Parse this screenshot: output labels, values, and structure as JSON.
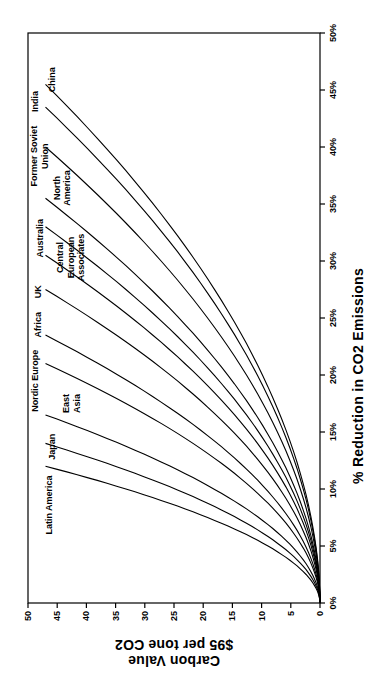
{
  "figure": {
    "background_color": "#ffffff",
    "line_color": "#000000",
    "text_color": "#000000",
    "rotation_deg": -90
  },
  "chart_data": {
    "type": "line",
    "title": "",
    "xlabel": "% Reduction in CO2 Emissions",
    "ylabel_lines": [
      "Carbon Value",
      "$95 per tone CO2"
    ],
    "legend": "none (curves labeled directly at their endpoints)",
    "grid": false,
    "x_axis": {
      "min": 0,
      "max": 50,
      "tick_step": 5,
      "tick_labels": [
        "0%",
        "5%",
        "10%",
        "15%",
        "20%",
        "25%",
        "30%",
        "35%",
        "40%",
        "45%",
        "50%"
      ]
    },
    "y_axis": {
      "min": 0,
      "max": 50,
      "tick_step": 5,
      "tick_labels": [
        "0",
        "5",
        "10",
        "15",
        "20",
        "25",
        "30",
        "35",
        "40",
        "45",
        "50"
      ]
    },
    "curve_model": {
      "tip_carbon_value": 47,
      "exponent": 1.9
    },
    "series": [
      {
        "name": "Latin America",
        "max_reduction_pct": 12,
        "points": [
          [
            0,
            0
          ],
          [
            2.4,
            2.2
          ],
          [
            4.8,
            8.2
          ],
          [
            7.2,
            17.8
          ],
          [
            9.6,
            30.8
          ],
          [
            12,
            47
          ]
        ],
        "label_lines": [
          "Latin America"
        ],
        "label_x": 8.6,
        "label_y": 46.4
      },
      {
        "name": "Japan",
        "max_reduction_pct": 14,
        "points": [
          [
            0,
            0
          ],
          [
            2.8,
            2.2
          ],
          [
            5.6,
            8.2
          ],
          [
            8.4,
            17.8
          ],
          [
            11.2,
            30.8
          ],
          [
            14,
            47
          ]
        ],
        "label_lines": [
          "Japan"
        ],
        "label_x": 13.7,
        "label_y": 45.9
      },
      {
        "name": "East Asia",
        "max_reduction_pct": 16.5,
        "points": [
          [
            0,
            0
          ],
          [
            3.3,
            2.2
          ],
          [
            6.6,
            8.2
          ],
          [
            9.9,
            17.8
          ],
          [
            13.2,
            30.8
          ],
          [
            16.5,
            47
          ]
        ],
        "label_lines": [
          "East",
          "Asia"
        ],
        "label_x": 17.5,
        "label_y": 42.6
      },
      {
        "name": "Nordic Europe",
        "max_reduction_pct": 21,
        "points": [
          [
            0,
            0
          ],
          [
            4.2,
            2.2
          ],
          [
            8.4,
            8.2
          ],
          [
            12.6,
            17.8
          ],
          [
            16.8,
            30.8
          ],
          [
            21,
            47
          ]
        ],
        "label_lines": [
          "Nordic Europe"
        ],
        "label_x": 19.5,
        "label_y": 48.8
      },
      {
        "name": "Africa",
        "max_reduction_pct": 23.5,
        "points": [
          [
            0,
            0
          ],
          [
            4.7,
            2.2
          ],
          [
            9.4,
            8.2
          ],
          [
            14.1,
            17.8
          ],
          [
            18.8,
            30.8
          ],
          [
            23.5,
            47
          ]
        ],
        "label_lines": [
          "Africa"
        ],
        "label_x": 24.4,
        "label_y": 48.3
      },
      {
        "name": "UK",
        "max_reduction_pct": 27.5,
        "points": [
          [
            0,
            0
          ],
          [
            5.5,
            2.2
          ],
          [
            11,
            8.2
          ],
          [
            16.5,
            17.8
          ],
          [
            22,
            30.8
          ],
          [
            27.5,
            47
          ]
        ],
        "label_lines": [
          "UK"
        ],
        "label_x": 27.3,
        "label_y": 48.3
      },
      {
        "name": "Central European Associates",
        "max_reduction_pct": 30.5,
        "points": [
          [
            0,
            0
          ],
          [
            6.1,
            2.2
          ],
          [
            12.2,
            8.2
          ],
          [
            18.3,
            17.8
          ],
          [
            24.4,
            30.8
          ],
          [
            30.5,
            47
          ]
        ],
        "label_lines": [
          "Central",
          "European",
          "Associates"
        ],
        "label_x": 30.3,
        "label_y": 42.6
      },
      {
        "name": "Australia",
        "max_reduction_pct": 33,
        "points": [
          [
            0,
            0
          ],
          [
            6.6,
            2.2
          ],
          [
            13.2,
            8.2
          ],
          [
            19.8,
            17.8
          ],
          [
            26.4,
            30.8
          ],
          [
            33,
            47
          ]
        ],
        "label_lines": [
          "Australia"
        ],
        "label_x": 32.0,
        "label_y": 47.9
      },
      {
        "name": "North America",
        "max_reduction_pct": 35.5,
        "points": [
          [
            0,
            0
          ],
          [
            7.1,
            2.2
          ],
          [
            14.2,
            8.2
          ],
          [
            21.3,
            17.8
          ],
          [
            28.4,
            30.8
          ],
          [
            35.5,
            47
          ]
        ],
        "label_lines": [
          "North",
          "America"
        ],
        "label_x": 36.4,
        "label_y": 44.2
      },
      {
        "name": "Former Soviet Union",
        "max_reduction_pct": 40,
        "points": [
          [
            0,
            0
          ],
          [
            8,
            2.2
          ],
          [
            16,
            8.2
          ],
          [
            24,
            17.8
          ],
          [
            32,
            30.8
          ],
          [
            40,
            47
          ]
        ],
        "label_lines": [
          "Former Soviet",
          "Union"
        ],
        "label_x": 39.2,
        "label_y": 48.1
      },
      {
        "name": "India",
        "max_reduction_pct": 43.5,
        "points": [
          [
            0,
            0
          ],
          [
            8.7,
            2.2
          ],
          [
            17.4,
            8.2
          ],
          [
            26.1,
            17.8
          ],
          [
            34.8,
            30.8
          ],
          [
            43.5,
            47
          ]
        ],
        "label_lines": [
          "India"
        ],
        "label_x": 44.0,
        "label_y": 48.8
      },
      {
        "name": "China",
        "max_reduction_pct": 45.5,
        "points": [
          [
            0,
            0
          ],
          [
            9.1,
            2.2
          ],
          [
            18.2,
            8.2
          ],
          [
            27.3,
            17.8
          ],
          [
            36.4,
            30.8
          ],
          [
            45.5,
            47
          ]
        ],
        "label_lines": [
          "China"
        ],
        "label_x": 45.9,
        "label_y": 45.9
      }
    ]
  }
}
